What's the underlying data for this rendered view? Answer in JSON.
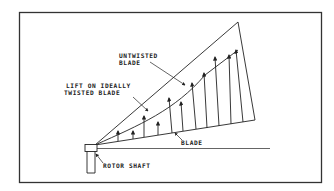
{
  "diagram": {
    "type": "rotor-blade-lift-distribution",
    "labels": {
      "untwisted_line1": "UNTWISTED",
      "untwisted_line2": "BLADE",
      "lift_line1": "LIFT ON IDEALLY",
      "lift_line2": "TWISTED BLADE",
      "blade": "BLADE",
      "rotor_shaft": "ROTOR SHAFT"
    },
    "colors": {
      "ink": "#222222",
      "background": "#ffffff"
    }
  }
}
